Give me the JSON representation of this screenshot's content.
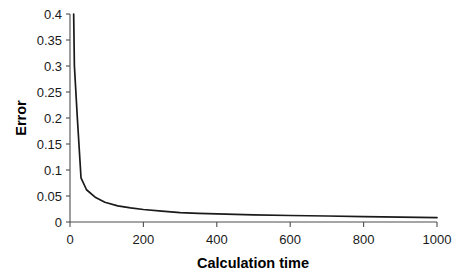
{
  "chart_data": {
    "type": "line",
    "title": "",
    "xlabel": "Calculation time",
    "ylabel": "Error",
    "xlim": [
      0,
      1000
    ],
    "ylim": [
      0,
      0.4
    ],
    "grid": false,
    "legend": null,
    "legend_position": "none",
    "line_color": "#1a1a1a",
    "axis_color": "#4d4d4d",
    "background_color": "#ffffff",
    "x_ticks": [
      0,
      200,
      400,
      600,
      800,
      1000
    ],
    "x_tick_labels": [
      "0",
      "200",
      "400",
      "600",
      "800",
      "1000"
    ],
    "y_ticks": [
      0,
      0.05,
      0.1,
      0.15,
      0.2,
      0.25,
      0.3,
      0.35,
      0.4
    ],
    "y_tick_labels": [
      "0",
      "0.05",
      "0.1",
      "0.15",
      "0.2",
      "0.25",
      "0.3",
      "0.35",
      "0.4"
    ],
    "series": [
      {
        "name": "Error",
        "x": [
          10,
          12,
          20,
          30,
          45,
          70,
          95,
          130,
          165,
          200,
          250,
          300,
          350,
          400,
          500,
          600,
          700,
          800,
          900,
          1000
        ],
        "y": [
          0.4,
          0.3,
          0.2,
          0.085,
          0.062,
          0.047,
          0.038,
          0.031,
          0.027,
          0.024,
          0.021,
          0.018,
          0.0165,
          0.0155,
          0.0138,
          0.0125,
          0.0115,
          0.0105,
          0.0095,
          0.0085
        ]
      }
    ]
  }
}
